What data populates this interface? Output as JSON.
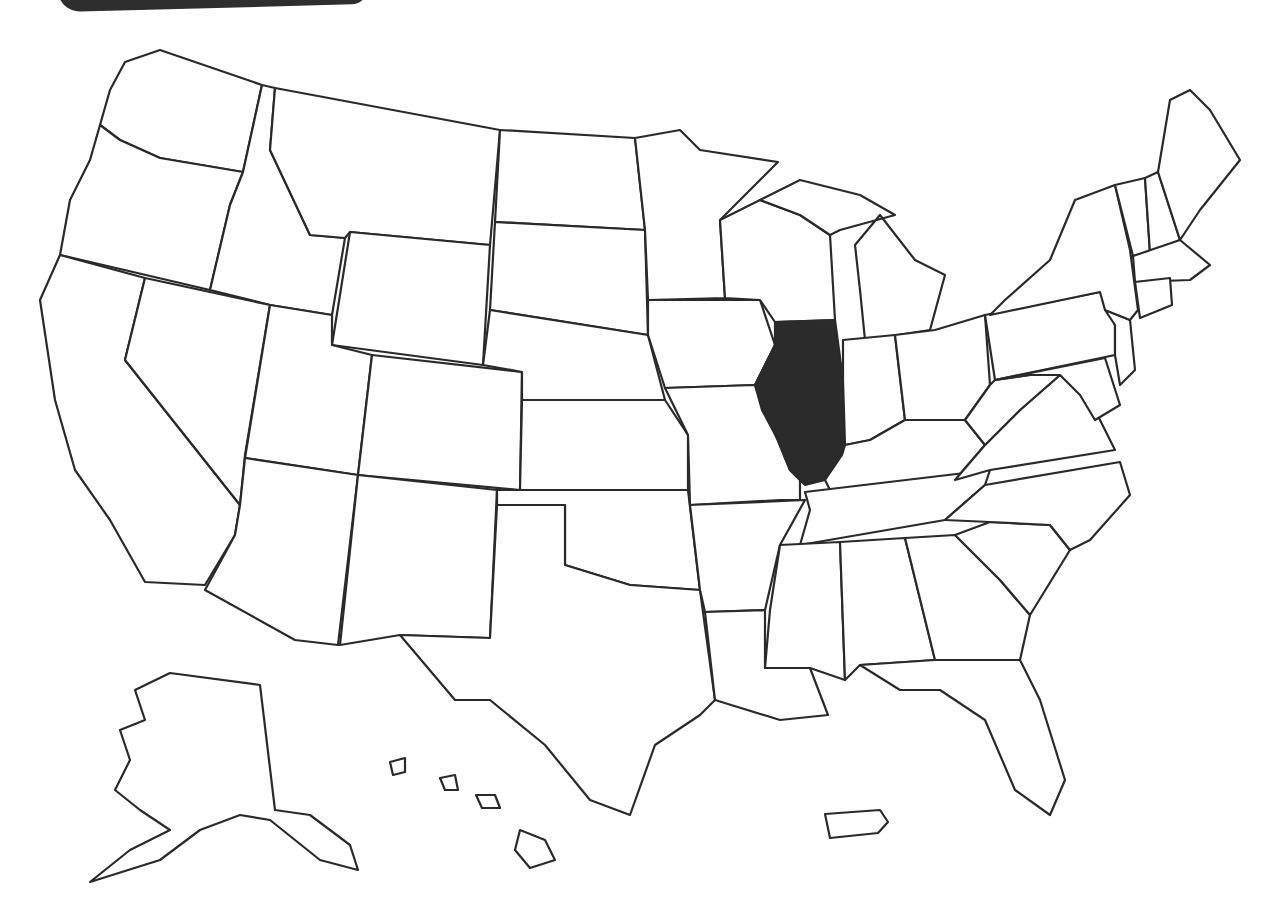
{
  "map": {
    "type": "outline",
    "region": "United States",
    "highlighted_state": "Illinois",
    "highlight_color": "#2b2b2b",
    "fill_color": "#ffffff",
    "stroke_color": "#2a2a2a",
    "insets": [
      "Alaska",
      "Hawaii",
      "Puerto Rico"
    ],
    "labels": []
  }
}
